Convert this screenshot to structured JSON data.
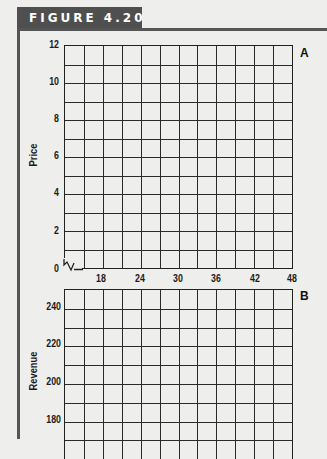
{
  "figure": {
    "title": "FIGURE 4.20",
    "colors": {
      "tab_background": "#4f4f4f",
      "tab_text": "#ffffff",
      "frame_rule": "#555555",
      "grid_line": "#2a2a2a",
      "background": "#eeeeec"
    }
  },
  "chart_data": [
    {
      "panel": "A",
      "type": "line",
      "title": "",
      "xlabel": "",
      "ylabel": "Price",
      "xlim": [
        12,
        48
      ],
      "ylim": [
        0,
        12
      ],
      "x_ticks": [
        18,
        24,
        30,
        36,
        42,
        48
      ],
      "y_ticks": [
        0,
        2,
        4,
        6,
        8,
        10,
        12
      ],
      "grid": true,
      "grid_x_step": 3,
      "grid_y_step": 1,
      "axis_break": "x-axis between 0 and first column",
      "series": []
    },
    {
      "panel": "B",
      "type": "line",
      "title": "",
      "xlabel": "",
      "ylabel": "Revenue",
      "xlim": [
        12,
        48
      ],
      "ylim_visible": [
        170,
        250
      ],
      "y_ticks": [
        180,
        200,
        220,
        240
      ],
      "grid": true,
      "grid_x_step": 3,
      "grid_y_step": 10,
      "series": []
    }
  ],
  "panels": {
    "a": {
      "label": "A",
      "ylabel": "Price",
      "y_ticks": [
        "12",
        "10",
        "8",
        "6",
        "4",
        "2",
        "0"
      ],
      "x_ticks": [
        "18",
        "24",
        "30",
        "36",
        "42",
        "48"
      ]
    },
    "b": {
      "label": "B",
      "ylabel": "Revenue",
      "y_ticks": [
        "240",
        "220",
        "200",
        "180"
      ]
    }
  }
}
